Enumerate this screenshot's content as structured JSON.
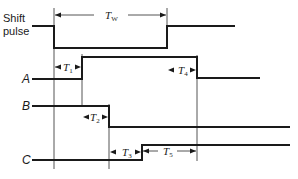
{
  "diagram": {
    "type": "timing-diagram",
    "signals": [
      {
        "id": "shift",
        "label_line1": "Shift",
        "label_line2": "pulse",
        "initial": "high",
        "transitions": [
          "fall",
          "rise"
        ]
      },
      {
        "id": "A",
        "label": "A",
        "initial": "low",
        "transitions": [
          "rise",
          "fall"
        ]
      },
      {
        "id": "B",
        "label": "B",
        "initial": "high",
        "transitions": [
          "fall"
        ]
      },
      {
        "id": "C",
        "label": "C",
        "initial": "low",
        "transitions": [
          "rise"
        ]
      }
    ],
    "intervals": [
      {
        "id": "TW",
        "main": "T",
        "sub": "W",
        "from": "shift fall",
        "to": "shift rise"
      },
      {
        "id": "T1",
        "main": "T",
        "sub": "1",
        "from": "shift fall",
        "to": "A rise"
      },
      {
        "id": "T2",
        "main": "T",
        "sub": "2",
        "from": "A rise",
        "to": "B fall"
      },
      {
        "id": "T3",
        "main": "T",
        "sub": "3",
        "from": "B fall",
        "to": "C rise"
      },
      {
        "id": "T4",
        "main": "T",
        "sub": "4",
        "from": "shift rise",
        "to": "A fall"
      },
      {
        "id": "T5",
        "main": "T",
        "sub": "5",
        "from": "C rise",
        "to": "A fall"
      }
    ]
  }
}
